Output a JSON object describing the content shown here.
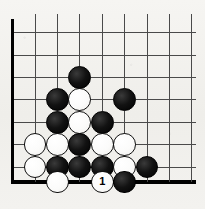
{
  "diagram": {
    "kind": "go-board",
    "board": {
      "visible_columns": 9,
      "visible_rows": 8,
      "origin_x": 12.6,
      "origin_y": 32.6,
      "spacing": 22.4,
      "bottom_edge_y": 182.0,
      "right_extent_x": 196.0,
      "edge_line_color": "#000000",
      "grid_line_color": "#4a4a4a",
      "board_color": "#f3f2ef",
      "edge_line_width": 3.2,
      "grid_line_width": 1.0,
      "edges": [
        "left",
        "bottom"
      ]
    },
    "stone_radius": 11.4,
    "colors": {
      "black_stone": "#000000",
      "white_stone": "#ffffff",
      "white_stone_outline": "#101010",
      "move_number_text": "#000000"
    },
    "stones": [
      {
        "id": "s1",
        "color": "black",
        "col": 3,
        "row": 2,
        "label": ""
      },
      {
        "id": "s2",
        "color": "black",
        "col": 2,
        "row": 3,
        "label": ""
      },
      {
        "id": "s3",
        "color": "white",
        "col": 3,
        "row": 3,
        "label": ""
      },
      {
        "id": "s4",
        "color": "black",
        "col": 5,
        "row": 3,
        "label": ""
      },
      {
        "id": "s5",
        "color": "black",
        "col": 2,
        "row": 4,
        "label": ""
      },
      {
        "id": "s6",
        "color": "white",
        "col": 3,
        "row": 4,
        "label": ""
      },
      {
        "id": "s7",
        "color": "black",
        "col": 4,
        "row": 4,
        "label": ""
      },
      {
        "id": "s8",
        "color": "white",
        "col": 1,
        "row": 5,
        "label": ""
      },
      {
        "id": "s9",
        "color": "white",
        "col": 2,
        "row": 5,
        "label": ""
      },
      {
        "id": "s10",
        "color": "black",
        "col": 3,
        "row": 5,
        "label": ""
      },
      {
        "id": "s11",
        "color": "white",
        "col": 4,
        "row": 5,
        "label": ""
      },
      {
        "id": "s12",
        "color": "white",
        "col": 5,
        "row": 5,
        "label": ""
      },
      {
        "id": "s13",
        "color": "white",
        "col": 1,
        "row": 6,
        "label": ""
      },
      {
        "id": "s14",
        "color": "black",
        "col": 2,
        "row": 6,
        "label": ""
      },
      {
        "id": "s15",
        "color": "black",
        "col": 3,
        "row": 6,
        "label": ""
      },
      {
        "id": "s16",
        "color": "black",
        "col": 4,
        "row": 6,
        "label": ""
      },
      {
        "id": "s17",
        "color": "white",
        "col": 5,
        "row": 6,
        "label": ""
      },
      {
        "id": "s18",
        "color": "black",
        "col": 6,
        "row": 6,
        "label": ""
      },
      {
        "id": "s19",
        "color": "white",
        "col": 2,
        "row": 7,
        "label": ""
      },
      {
        "id": "s20",
        "color": "white",
        "col": 4,
        "row": 7,
        "label": "1"
      },
      {
        "id": "s21",
        "color": "black",
        "col": 5,
        "row": 7,
        "label": ""
      }
    ],
    "move_numbers": [
      {
        "number": "1",
        "color": "white",
        "col": 4,
        "row": 7
      }
    ]
  }
}
